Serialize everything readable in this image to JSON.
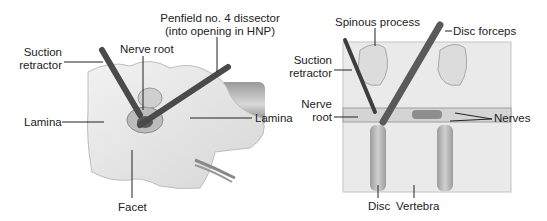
{
  "figure": {
    "left_panel": {
      "name": "posterior view of lamina with instruments",
      "labels": {
        "penfield_line1": "Penfield no. 4 dissector",
        "penfield_line2": "(into opening in HNP)",
        "suction_line1": "Suction",
        "suction_line2": "retractor",
        "nerve_root": "Nerve root",
        "lamina_left": "Lamina",
        "lamina_right": "Lamina",
        "facet": "Facet"
      }
    },
    "right_panel": {
      "name": "lateral view of spine with instruments",
      "labels": {
        "spinous_process": "Spinous process",
        "disc_forceps": "Disc forceps",
        "suction_line1": "Suction",
        "suction_line2": "retractor",
        "nerve_line1": "Nerve",
        "nerve_line2": "root",
        "nerves": "Nerves",
        "disc": "Disc",
        "vertebra": "Vertebra"
      }
    },
    "colors": {
      "bone": "#e9e9e9",
      "bone_shade": "#cfcfcf",
      "instrument": "#555555",
      "leader": "#222222",
      "text": "#222222"
    }
  }
}
